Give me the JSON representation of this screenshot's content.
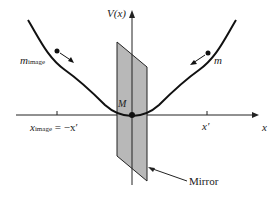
{
  "diagram": {
    "axis_labels": {
      "y": "V(x)",
      "x": "x"
    },
    "points": {
      "origin_label": "M",
      "x_prime": "x′",
      "x_image_main": "x",
      "x_image_sub": "image",
      "x_image_rhs": " = −x′"
    },
    "masses": {
      "left_main": "m",
      "left_sub": "image",
      "right": "m"
    },
    "mirror_label": "Mirror",
    "colors": {
      "line": "#111111",
      "mirror_fill": "#b8b8b8",
      "mirror_edge": "#222222"
    }
  }
}
